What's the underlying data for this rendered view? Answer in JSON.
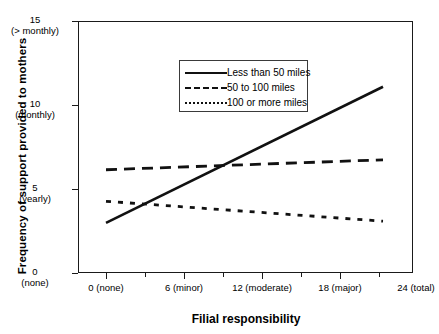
{
  "chart_data": {
    "type": "line",
    "title": "",
    "xlabel": "Filial responsibility",
    "ylabel": "Frequency of support provided to mothers",
    "xlim": [
      0,
      24
    ],
    "ylim": [
      0,
      15
    ],
    "grid": false,
    "legend_position": "top-left inside plot",
    "x": [
      0,
      24
    ],
    "xticks": [
      {
        "value": 0,
        "label": "0 (none)"
      },
      {
        "value": 6,
        "label": "6 (minor)"
      },
      {
        "value": 12,
        "label": "12 (moderate)"
      },
      {
        "value": 18,
        "label": "18 (major)"
      },
      {
        "value": 24,
        "label": "24 (total)"
      }
    ],
    "yticks": [
      {
        "value": 15,
        "label": "15",
        "descriptor": "(> monthly)"
      },
      {
        "value": 10,
        "label": "10",
        "descriptor": "(monthly)"
      },
      {
        "value": 5,
        "label": "5",
        "descriptor": "(yearly)"
      },
      {
        "value": 0,
        "label": "0",
        "descriptor": "(none)"
      }
    ],
    "series": [
      {
        "name": "Less than 50 miles",
        "style": "solid",
        "values": [
          2.9,
          11.1
        ]
      },
      {
        "name": "50 to 100 miles",
        "style": "dashed",
        "values": [
          6.1,
          6.7
        ]
      },
      {
        "name": "100 or more miles",
        "style": "dotted",
        "values": [
          4.2,
          3.0
        ]
      }
    ]
  },
  "legend": {
    "items": [
      {
        "label": "Less than 50 miles"
      },
      {
        "label": "50 to 100 miles"
      },
      {
        "label": "100 or more miles"
      }
    ]
  },
  "colors": {
    "line": "#111111",
    "axis": "#1a1a1a",
    "background": "#ffffff"
  }
}
